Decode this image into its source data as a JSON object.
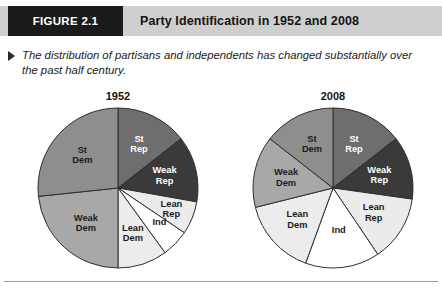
{
  "header": {
    "figure_tag": "FIGURE 2.1",
    "title": "Party Identification in 1952 and 2008",
    "tab_bg": "#1a1a1a",
    "band_bg": "#cfcfcf"
  },
  "caption": {
    "bullet": "triangle-right-icon",
    "text": "The distribution of partisans and independents has changed substantially over the past half century."
  },
  "palette": {
    "st_rep": "#6e6e6e",
    "weak_rep": "#3a3a3a",
    "lean_rep": "#ebebeb",
    "ind": "#ffffff",
    "lean_dem": "#ececec",
    "weak_dem": "#a8a8a8",
    "st_dem": "#8e8e8e",
    "outline": "#2e2e2e"
  },
  "chart_data": [
    {
      "type": "pie",
      "title": "1952",
      "xlabel": "",
      "ylabel": "",
      "legend": "in-slice labels",
      "categories": [
        "St Rep",
        "Weak Rep",
        "Lean Rep",
        "Ind",
        "Lean Dem",
        "Weak Dem",
        "St Dem"
      ],
      "values": [
        14.4,
        13.3,
        6.7,
        5.6,
        10.0,
        23.3,
        26.7
      ],
      "units": "percent",
      "start_angle_deg": 0,
      "direction": "clockwise",
      "slices": [
        {
          "label": "St Rep",
          "value": 14.4,
          "angle_deg": 52,
          "color": "#6e6e6e",
          "text_color": "light"
        },
        {
          "label": "Weak Rep",
          "value": 13.3,
          "angle_deg": 48,
          "color": "#3a3a3a",
          "text_color": "light"
        },
        {
          "label": "Lean Rep",
          "value": 6.7,
          "angle_deg": 24,
          "color": "#ebebeb",
          "text_color": "dark"
        },
        {
          "label": "Ind",
          "value": 5.6,
          "angle_deg": 20,
          "color": "#ffffff",
          "text_color": "dark"
        },
        {
          "label": "Lean Dem",
          "value": 10.0,
          "angle_deg": 36,
          "color": "#ececec",
          "text_color": "dark"
        },
        {
          "label": "Weak Dem",
          "value": 23.3,
          "angle_deg": 84,
          "color": "#a8a8a8",
          "text_color": "dark"
        },
        {
          "label": "St Dem",
          "value": 26.7,
          "angle_deg": 96,
          "color": "#8e8e8e",
          "text_color": "dark"
        }
      ]
    },
    {
      "type": "pie",
      "title": "2008",
      "xlabel": "",
      "ylabel": "",
      "legend": "in-slice labels",
      "categories": [
        "St Rep",
        "Weak Rep",
        "Lean Rep",
        "Ind",
        "Lean Dem",
        "Weak Dem",
        "St Dem"
      ],
      "values": [
        14.4,
        12.8,
        13.3,
        15.0,
        15.6,
        14.4,
        14.4
      ],
      "units": "percent",
      "start_angle_deg": 0,
      "direction": "clockwise",
      "slices": [
        {
          "label": "St Rep",
          "value": 14.4,
          "angle_deg": 52,
          "color": "#6e6e6e",
          "text_color": "light"
        },
        {
          "label": "Weak Rep",
          "value": 12.8,
          "angle_deg": 46,
          "color": "#3a3a3a",
          "text_color": "light"
        },
        {
          "label": "Lean Rep",
          "value": 13.3,
          "angle_deg": 48,
          "color": "#ebebeb",
          "text_color": "dark"
        },
        {
          "label": "Ind",
          "value": 15.0,
          "angle_deg": 54,
          "color": "#ffffff",
          "text_color": "dark"
        },
        {
          "label": "Lean Dem",
          "value": 15.6,
          "angle_deg": 56,
          "color": "#ececec",
          "text_color": "dark"
        },
        {
          "label": "Weak Dem",
          "value": 14.4,
          "angle_deg": 52,
          "color": "#a8a8a8",
          "text_color": "dark"
        },
        {
          "label": "St Dem",
          "value": 14.4,
          "angle_deg": 52,
          "color": "#8e8e8e",
          "text_color": "dark"
        }
      ]
    }
  ]
}
